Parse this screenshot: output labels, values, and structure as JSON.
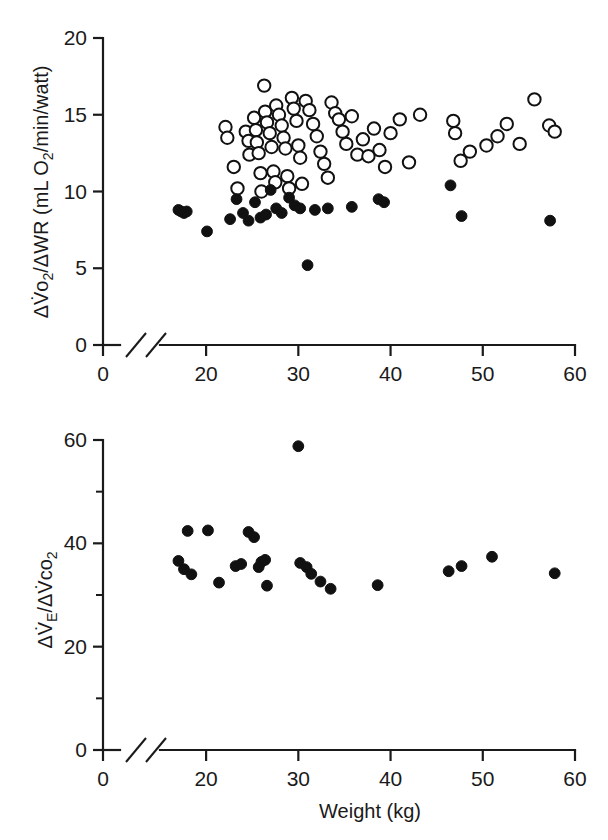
{
  "figure": {
    "background": "#ffffff",
    "ink": "#1a1a1a",
    "marker_open_fill": "#ffffff",
    "marker_filled_fill": "#111111",
    "xlabel": "Weight (kg)"
  },
  "shared_x": {
    "label": "Weight (kg)",
    "tick_labels": [
      "0",
      "20",
      "30",
      "40",
      "50",
      "60"
    ],
    "tick_values": [
      0,
      20,
      30,
      40,
      50,
      60
    ],
    "break_after_zero": true,
    "range_main": [
      15,
      60
    ]
  },
  "panels": [
    {
      "id": "top",
      "ylabel_parts": {
        "p1": "ΔV̇o",
        "p1sub": "2",
        "p2": "/ΔWR (mL O",
        "p2sub": "2",
        "p3": "/min/watt)"
      },
      "ylabel_plain": "ΔV̇o2/ΔWR (mL O2/min/watt)",
      "y_tick_labels": [
        "0",
        "5",
        "10",
        "15",
        "20"
      ],
      "y_tick_values": [
        0,
        5,
        10,
        15,
        20
      ],
      "ylim": [
        0,
        20
      ]
    },
    {
      "id": "bottom",
      "ylabel_parts": {
        "p1": "ΔV̇",
        "p1sub": "E",
        "p2": "/ΔV̇co",
        "p2sub": "2"
      },
      "ylabel_plain": "ΔV̇E/ΔV̇co2",
      "y_tick_labels": [
        "0",
        "20",
        "40",
        "60"
      ],
      "y_tick_values": [
        0,
        20,
        40,
        60
      ],
      "y_minor_values": [
        10,
        30,
        50
      ],
      "ylim": [
        0,
        60
      ]
    }
  ],
  "chart_data": [
    {
      "type": "scatter",
      "panel": "top",
      "title": "",
      "xlabel": "Weight (kg)",
      "ylabel": "ΔV̇o2/ΔWR (mL O2/min/watt)",
      "xlim": [
        15,
        60
      ],
      "ylim": [
        0,
        20
      ],
      "xticks": [
        0,
        20,
        30,
        40,
        50,
        60
      ],
      "yticks": [
        0,
        5,
        10,
        15,
        20
      ],
      "grid": false,
      "legend": "none",
      "axis_break_x": true,
      "series": [
        {
          "name": "open-circles",
          "marker": "open-circle",
          "x": [
            22.1,
            22.3,
            23.0,
            23.4,
            24.3,
            24.6,
            24.7,
            25.2,
            25.4,
            25.5,
            25.7,
            25.9,
            26.0,
            26.3,
            26.4,
            26.6,
            26.9,
            27.1,
            27.3,
            27.5,
            27.6,
            27.9,
            28.2,
            28.4,
            28.6,
            28.8,
            29.0,
            29.3,
            29.5,
            29.8,
            30.0,
            30.2,
            30.4,
            30.8,
            31.2,
            31.6,
            32.0,
            32.4,
            32.8,
            33.2,
            33.6,
            34.0,
            34.4,
            34.8,
            35.2,
            35.8,
            36.4,
            37.0,
            37.6,
            38.2,
            38.8,
            39.4,
            40.0,
            41.0,
            42.0,
            43.2,
            46.8,
            47.0,
            47.6,
            48.6,
            50.4,
            51.6,
            52.6,
            54.0,
            55.6,
            57.2,
            57.8
          ],
          "y": [
            14.2,
            13.5,
            11.6,
            10.2,
            13.9,
            13.3,
            12.4,
            14.8,
            14.0,
            13.2,
            12.5,
            11.2,
            10.0,
            16.9,
            15.2,
            14.5,
            13.8,
            12.9,
            11.3,
            10.6,
            15.6,
            15.0,
            14.3,
            13.5,
            12.8,
            11.0,
            10.2,
            16.1,
            15.4,
            14.6,
            13.0,
            12.2,
            10.5,
            15.9,
            15.3,
            14.4,
            13.6,
            12.6,
            11.8,
            10.9,
            15.8,
            15.1,
            14.7,
            13.9,
            13.1,
            14.9,
            12.4,
            13.4,
            12.3,
            14.1,
            12.7,
            11.6,
            13.8,
            14.7,
            11.9,
            15.0,
            14.6,
            13.8,
            12.0,
            12.6,
            13.0,
            13.6,
            14.4,
            13.1,
            16.0,
            14.3,
            13.9
          ]
        },
        {
          "name": "filled-circles",
          "marker": "filled-circle",
          "x": [
            17.0,
            17.3,
            17.6,
            17.9,
            20.1,
            22.6,
            23.3,
            24.0,
            24.6,
            25.3,
            25.9,
            26.5,
            27.0,
            27.6,
            28.2,
            29.0,
            29.6,
            30.2,
            31.0,
            31.8,
            33.2,
            35.8,
            38.7,
            39.3,
            46.5,
            47.7,
            57.3
          ],
          "y": [
            8.8,
            8.7,
            8.6,
            8.7,
            7.4,
            8.2,
            9.5,
            8.6,
            8.1,
            9.3,
            8.3,
            8.5,
            10.1,
            8.9,
            8.6,
            9.6,
            9.1,
            8.9,
            5.2,
            8.8,
            8.9,
            9.0,
            9.5,
            9.3,
            10.4,
            8.4,
            8.1
          ]
        }
      ]
    },
    {
      "type": "scatter",
      "panel": "bottom",
      "title": "",
      "xlabel": "Weight (kg)",
      "ylabel": "ΔV̇E/ΔV̇co2",
      "xlim": [
        15,
        60
      ],
      "ylim": [
        0,
        60
      ],
      "xticks": [
        0,
        20,
        30,
        40,
        50,
        60
      ],
      "yticks": [
        0,
        20,
        40,
        60
      ],
      "yminorticks": [
        10,
        30,
        50
      ],
      "grid": false,
      "legend": "none",
      "axis_break_x": true,
      "series": [
        {
          "name": "filled-circles",
          "marker": "filled-circle",
          "x": [
            17.0,
            17.6,
            18.0,
            18.4,
            20.2,
            21.4,
            23.2,
            23.8,
            24.6,
            25.2,
            25.7,
            26.0,
            26.4,
            26.6,
            30.0,
            30.2,
            30.9,
            31.4,
            32.4,
            33.5,
            38.6,
            46.3,
            47.7,
            51.0,
            57.8
          ],
          "y": [
            36.6,
            35.0,
            42.4,
            34.0,
            42.5,
            32.4,
            35.6,
            36.0,
            42.2,
            41.2,
            35.4,
            36.4,
            36.8,
            31.8,
            58.8,
            36.2,
            35.4,
            34.1,
            32.6,
            31.2,
            31.9,
            34.6,
            35.6,
            37.4,
            34.2
          ]
        }
      ]
    }
  ]
}
